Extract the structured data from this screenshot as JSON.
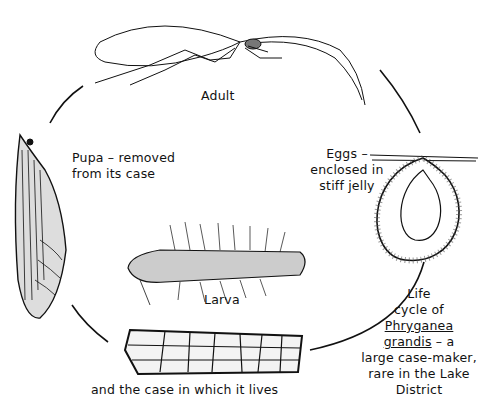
{
  "diagram": {
    "title": "Life cycle of Phryganea grandis",
    "stages": [
      {
        "id": "adult",
        "label": "Adult"
      },
      {
        "id": "eggs",
        "label_lines": [
          "Eggs –",
          "enclosed in",
          "stiff jelly"
        ]
      },
      {
        "id": "larva",
        "label": "Larva"
      },
      {
        "id": "case",
        "label": "and the case in which it lives"
      },
      {
        "id": "pupa",
        "label_lines": [
          "Pupa – removed",
          "from its case"
        ]
      }
    ],
    "caption": {
      "line1": "Life",
      "line2": "cycle of",
      "species_genus": "Phryganea",
      "species_epithet": "grandis",
      "line4_suffix": " – a",
      "line5": "large case-maker,",
      "line6": "rare in the Lake",
      "line7": "District"
    },
    "colors": {
      "ink": "#111111",
      "background": "#ffffff"
    }
  }
}
